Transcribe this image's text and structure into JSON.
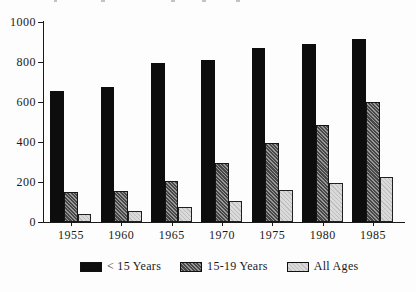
{
  "chart_data": {
    "type": "bar",
    "title": "",
    "categories": [
      "1955",
      "1960",
      "1965",
      "1970",
      "1975",
      "1980",
      "1985"
    ],
    "series": [
      {
        "name": "< 15 Years",
        "style": "solid-black",
        "values": [
          655,
          675,
          795,
          810,
          870,
          890,
          915
        ]
      },
      {
        "name": "15-19 Years",
        "style": "hatched-dark",
        "values": [
          150,
          155,
          205,
          295,
          395,
          485,
          600
        ]
      },
      {
        "name": "All Ages",
        "style": "hatched-light",
        "values": [
          40,
          55,
          75,
          105,
          160,
          195,
          225
        ]
      }
    ],
    "xlabel": "",
    "ylabel": "",
    "ylim": [
      0,
      1000
    ],
    "yticks": [
      0,
      200,
      400,
      600,
      800,
      1000
    ],
    "grid": false,
    "legend_position": "bottom"
  },
  "legend": {
    "items": [
      {
        "label": "< 15 Years",
        "style": "solid-black"
      },
      {
        "label": "15-19 Years",
        "style": "hatched-dark"
      },
      {
        "label": "All Ages",
        "style": "hatched-light"
      }
    ]
  },
  "colors": {
    "background": "#fdfdfd",
    "axis": "#1a1a1a",
    "bar_black": "#0d0d0d",
    "bar_dark_gray_avg": "#6e6e6e",
    "bar_light_gray_avg": "#cccccc",
    "text": "#1a1a1a"
  }
}
